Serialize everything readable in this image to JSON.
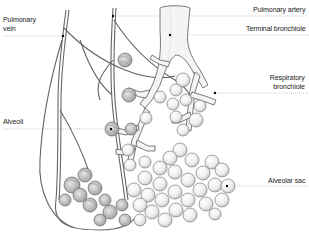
{
  "diagram": {
    "labels": {
      "pulmonary_vein_line1": "Pulmonary",
      "pulmonary_vein_line2": "vein",
      "pulmonary_artery": "Pulmonary artery",
      "terminal_bronchiole": "Terminal bronchiole",
      "respiratory_bronchiole_line1": "Respiratory",
      "respiratory_bronchiole_line2": "bronchiole",
      "alveoli": "Alveoli",
      "alveolar_sac": "Alveolar sac"
    },
    "colors": {
      "background": "#ffffff",
      "outline": "#5a5a5a",
      "fill": "#f4f4f4",
      "leader": "#9a9a9a",
      "text": "#222222"
    }
  }
}
